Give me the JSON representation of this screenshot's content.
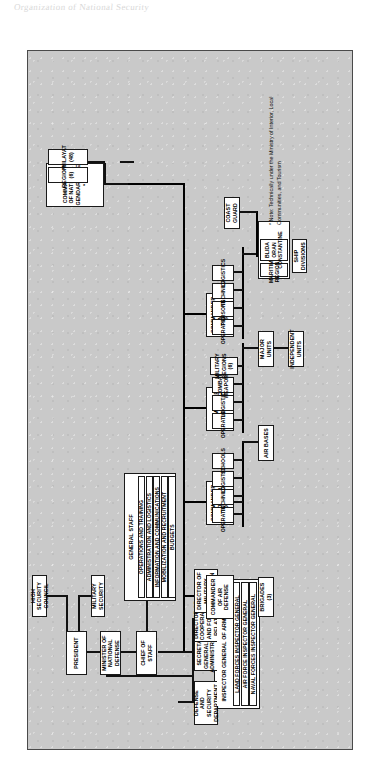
{
  "figure": {
    "note_marker": "*",
    "note_text": "Note: Technically under the Ministry of Interior, Local Communities, and Tourism",
    "scan_margin_text": "Organization of National Security"
  },
  "nodes": {
    "high_security_council": "HIGH SECURITY COUNCIL",
    "president": "PRESIDENT",
    "minister_national_defense": "MINISTER OF NATIONAL DEFENSE",
    "military_security": "MILITARY SECURITY",
    "chief_of_staff": "CHIEF OF STAFF",
    "defense_security_department": "DEFENSE AND SECURITY DEPARTMENT",
    "secretary_general_admin": "SECRETARY GENERAL FOR ADMINISTRATION",
    "director_cooperation": "DIRECTOR OF COOPERATION AND FOREIGN RELATIONS",
    "director_military_production": "DIRECTOR OF MILITARY PRODUCTION",
    "general_staff": "GENERAL STAFF",
    "inspector_general": "INSPECTOR GENERAL OF ARMED FORCES",
    "commander_air_defense": "COMMANDER OF AIR DEFENSE",
    "brigades": "BRIGADES (3)",
    "commander_air_force": "COMMANDER OF THE AIR FORCE",
    "air_bases": "AIR BASES",
    "commander_army": "COMMANDER OF THE ARMY",
    "military_regions": "MILITARY REGIONS (6)",
    "major_units": "MAJOR UNITS",
    "independent_units": "INDEPENDENT UNITS",
    "commander_navy": "COMMANDER OF NAVAL FORCES",
    "maritime_regions_label": "MARITIME REGIONS",
    "maritime_regions_list": "BLIDA\nORAN\nCONSTANTINE",
    "ship_divisions": "SHIP DIVISIONS",
    "coast_guard": "COAST GUARD",
    "commander_gendarmerie": "COMMANDER OF NATIONAL GENDARMERIE *",
    "regions": "REGIONS (6)",
    "wilayat": "WILAYAT (48)"
  },
  "general_staff_items": [
    "OPERATIONS AND TRAINING",
    "ADMINISTRATION AND LOGISTICS",
    "INFORMATION AND COMMUNICATIONS",
    "MOBILIZATION AND RECRUITMENT",
    "BUDGETS"
  ],
  "inspector_general_items": [
    "LAND FORCES INSPECTOR GENERAL",
    "AIR FORCE INSPECTOR GENERAL",
    "NAVAL FORCES INSPECTOR GENERAL"
  ],
  "air_force_items": [
    "OPERATIONS",
    "TECHNICAL",
    "LOGISTICS",
    "SCHOOLS"
  ],
  "army_items": [
    "OPERATIONS",
    "LOGISTICS",
    "COMBAT WEAPONS"
  ],
  "navy_items": [
    "OPERATIONS",
    "PERSONNEL",
    "TECHNICAL",
    "LOGISTICS"
  ],
  "colors": {
    "figure_background": "#c9c9c9",
    "box_fill": "#ffffff",
    "line": "#111111",
    "page": "#ffffff"
  }
}
